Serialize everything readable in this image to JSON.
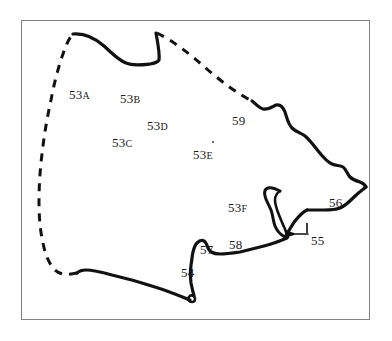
{
  "figure": {
    "kind": "map-outline-diagram",
    "background_color": "#ffffff",
    "frame_color": "#808080",
    "ink_color": "#111111"
  },
  "map": {
    "title": "",
    "boundary_styles": {
      "solid_label": "solid coastline",
      "dashed_label": "dashed inland boundary"
    },
    "labels": [
      {
        "id": "label-53a",
        "number": "53",
        "suffix": "A",
        "x": 69,
        "y": 88
      },
      {
        "id": "label-53b",
        "number": "53",
        "suffix": "B",
        "x": 120,
        "y": 92
      },
      {
        "id": "label-53c",
        "number": "53",
        "suffix": "C",
        "x": 112,
        "y": 136
      },
      {
        "id": "label-53d",
        "number": "53",
        "suffix": "D",
        "x": 147,
        "y": 119
      },
      {
        "id": "label-53e",
        "number": "53",
        "suffix": "E",
        "x": 193,
        "y": 148
      },
      {
        "id": "label-53f",
        "number": "53",
        "suffix": "F",
        "x": 228,
        "y": 201
      },
      {
        "id": "label-54",
        "number": "54",
        "suffix": "",
        "x": 181,
        "y": 266
      },
      {
        "id": "label-55",
        "number": "55",
        "suffix": "",
        "x": 311,
        "y": 234
      },
      {
        "id": "label-56",
        "number": "56",
        "suffix": "",
        "x": 329,
        "y": 196
      },
      {
        "id": "label-57",
        "number": "57",
        "suffix": "",
        "x": 200,
        "y": 243
      },
      {
        "id": "label-58",
        "number": "58",
        "suffix": "",
        "x": 229,
        "y": 238
      },
      {
        "id": "label-59",
        "number": "59",
        "suffix": "",
        "x": 232,
        "y": 114
      }
    ],
    "marks": [
      {
        "id": "mark-53e-dot",
        "x": 212,
        "y": 141
      },
      {
        "id": "mark-55-tick",
        "x": 307,
        "y": 228
      }
    ]
  }
}
